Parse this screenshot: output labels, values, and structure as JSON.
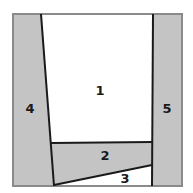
{
  "diagram": {
    "type": "paper-piecing-pattern",
    "colors": {
      "shaded": "#c4c4c4",
      "unshaded": "#ffffff",
      "line": "#1a1a1a",
      "border": "#8a8a8a"
    },
    "pieces": [
      {
        "id": "1",
        "label": "1",
        "shaded": false
      },
      {
        "id": "2",
        "label": "2",
        "shaded": true
      },
      {
        "id": "3",
        "label": "3",
        "shaded": false
      },
      {
        "id": "4",
        "label": "4",
        "shaded": true
      },
      {
        "id": "5",
        "label": "5",
        "shaded": true
      }
    ]
  }
}
